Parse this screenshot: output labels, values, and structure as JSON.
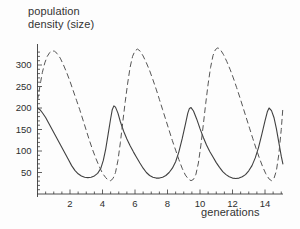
{
  "chart_data": {
    "type": "line",
    "title": "",
    "ylabel_lines": [
      "population",
      "density (size)"
    ],
    "ylabel": "population density (size)",
    "xlabel": "generations",
    "xlim": [
      0,
      15.1
    ],
    "ylim": [
      0,
      355
    ],
    "grid": false,
    "legend": "none",
    "xticks": [
      2,
      4,
      6,
      8,
      10,
      12,
      14
    ],
    "xtick_labels": [
      "2",
      "4",
      "6",
      "8",
      "10",
      "12",
      "14"
    ],
    "xminor_ticks": [
      0.5,
      1,
      1.5,
      2.5,
      3,
      3.5,
      4.5,
      5,
      5.5,
      6.5,
      7,
      7.5,
      8.5,
      9,
      9.5,
      10.5,
      11,
      11.5,
      12.5,
      13,
      13.5,
      14.5,
      15
    ],
    "yticks": [
      50,
      100,
      150,
      200,
      250,
      300
    ],
    "ytick_labels": [
      "50",
      "100",
      "150",
      "200",
      "250",
      "300"
    ],
    "yminor_ticks": [
      10,
      20,
      30,
      40,
      60,
      70,
      80,
      90,
      110,
      120,
      130,
      140,
      160,
      170,
      180,
      190,
      210,
      220,
      230,
      240,
      260,
      270,
      280,
      290,
      310,
      320,
      330
    ],
    "series": [
      {
        "name": "prey",
        "style": "solid",
        "color": "#404040",
        "points": [
          [
            0.0,
            200
          ],
          [
            0.15,
            196
          ],
          [
            0.3,
            189
          ],
          [
            0.5,
            178
          ],
          [
            0.7,
            164
          ],
          [
            0.9,
            150
          ],
          [
            1.1,
            136
          ],
          [
            1.3,
            122
          ],
          [
            1.5,
            108
          ],
          [
            1.7,
            94
          ],
          [
            1.9,
            80
          ],
          [
            2.1,
            66
          ],
          [
            2.3,
            55
          ],
          [
            2.5,
            47
          ],
          [
            2.7,
            42
          ],
          [
            2.9,
            39
          ],
          [
            3.1,
            38
          ],
          [
            3.3,
            39
          ],
          [
            3.5,
            42
          ],
          [
            3.7,
            48
          ],
          [
            3.9,
            60
          ],
          [
            4.05,
            78
          ],
          [
            4.2,
            105
          ],
          [
            4.35,
            140
          ],
          [
            4.5,
            175
          ],
          [
            4.6,
            196
          ],
          [
            4.7,
            205
          ],
          [
            4.8,
            202
          ],
          [
            4.95,
            188
          ],
          [
            5.1,
            168
          ],
          [
            5.3,
            146
          ],
          [
            5.5,
            128
          ],
          [
            5.7,
            112
          ],
          [
            5.9,
            98
          ],
          [
            6.1,
            85
          ],
          [
            6.3,
            72
          ],
          [
            6.5,
            60
          ],
          [
            6.7,
            50
          ],
          [
            6.9,
            43
          ],
          [
            7.1,
            39
          ],
          [
            7.3,
            37
          ],
          [
            7.5,
            37
          ],
          [
            7.7,
            39
          ],
          [
            7.9,
            43
          ],
          [
            8.1,
            50
          ],
          [
            8.3,
            60
          ],
          [
            8.5,
            75
          ],
          [
            8.7,
            98
          ],
          [
            8.9,
            128
          ],
          [
            9.1,
            162
          ],
          [
            9.25,
            188
          ],
          [
            9.35,
            199
          ],
          [
            9.45,
            201
          ],
          [
            9.6,
            193
          ],
          [
            9.8,
            174
          ],
          [
            10.0,
            152
          ],
          [
            10.2,
            132
          ],
          [
            10.4,
            114
          ],
          [
            10.6,
            99
          ],
          [
            10.8,
            86
          ],
          [
            11.0,
            73
          ],
          [
            11.2,
            62
          ],
          [
            11.4,
            52
          ],
          [
            11.6,
            45
          ],
          [
            11.8,
            40
          ],
          [
            12.0,
            37
          ],
          [
            12.2,
            36
          ],
          [
            12.4,
            37
          ],
          [
            12.6,
            40
          ],
          [
            12.8,
            45
          ],
          [
            13.0,
            54
          ],
          [
            13.2,
            66
          ],
          [
            13.4,
            84
          ],
          [
            13.6,
            108
          ],
          [
            13.8,
            138
          ],
          [
            14.0,
            170
          ],
          [
            14.15,
            192
          ],
          [
            14.25,
            200
          ],
          [
            14.4,
            194
          ],
          [
            14.55,
            178
          ],
          [
            14.7,
            152
          ],
          [
            14.85,
            120
          ],
          [
            15.0,
            88
          ],
          [
            15.1,
            70
          ]
        ]
      },
      {
        "name": "predator",
        "style": "dashed",
        "color": "#555555",
        "points": [
          [
            0.0,
            218
          ],
          [
            0.1,
            240
          ],
          [
            0.2,
            262
          ],
          [
            0.3,
            283
          ],
          [
            0.45,
            305
          ],
          [
            0.6,
            320
          ],
          [
            0.75,
            329
          ],
          [
            0.9,
            333
          ],
          [
            1.05,
            332
          ],
          [
            1.2,
            327
          ],
          [
            1.4,
            316
          ],
          [
            1.6,
            300
          ],
          [
            1.8,
            282
          ],
          [
            2.0,
            262
          ],
          [
            2.2,
            240
          ],
          [
            2.4,
            218
          ],
          [
            2.6,
            196
          ],
          [
            2.8,
            172
          ],
          [
            3.0,
            148
          ],
          [
            3.2,
            124
          ],
          [
            3.4,
            102
          ],
          [
            3.6,
            82
          ],
          [
            3.8,
            64
          ],
          [
            4.0,
            48
          ],
          [
            4.2,
            38
          ],
          [
            4.35,
            32
          ],
          [
            4.5,
            31
          ],
          [
            4.65,
            36
          ],
          [
            4.8,
            50
          ],
          [
            4.95,
            78
          ],
          [
            5.1,
            120
          ],
          [
            5.25,
            168
          ],
          [
            5.4,
            215
          ],
          [
            5.55,
            258
          ],
          [
            5.7,
            295
          ],
          [
            5.85,
            320
          ],
          [
            6.0,
            333
          ],
          [
            6.15,
            337
          ],
          [
            6.3,
            333
          ],
          [
            6.5,
            321
          ],
          [
            6.7,
            305
          ],
          [
            6.9,
            287
          ],
          [
            7.1,
            266
          ],
          [
            7.3,
            244
          ],
          [
            7.5,
            220
          ],
          [
            7.7,
            196
          ],
          [
            7.9,
            172
          ],
          [
            8.1,
            148
          ],
          [
            8.3,
            124
          ],
          [
            8.5,
            102
          ],
          [
            8.7,
            80
          ],
          [
            8.9,
            60
          ],
          [
            9.1,
            44
          ],
          [
            9.3,
            34
          ],
          [
            9.45,
            31
          ],
          [
            9.6,
            34
          ],
          [
            9.75,
            46
          ],
          [
            9.9,
            72
          ],
          [
            10.05,
            112
          ],
          [
            10.2,
            160
          ],
          [
            10.35,
            210
          ],
          [
            10.5,
            256
          ],
          [
            10.65,
            294
          ],
          [
            10.8,
            322
          ],
          [
            10.95,
            336
          ],
          [
            11.1,
            340
          ],
          [
            11.25,
            336
          ],
          [
            11.45,
            324
          ],
          [
            11.65,
            308
          ],
          [
            11.85,
            290
          ],
          [
            12.05,
            270
          ],
          [
            12.25,
            248
          ],
          [
            12.45,
            225
          ],
          [
            12.65,
            201
          ],
          [
            12.85,
            177
          ],
          [
            13.05,
            153
          ],
          [
            13.25,
            129
          ],
          [
            13.45,
            106
          ],
          [
            13.65,
            84
          ],
          [
            13.85,
            64
          ],
          [
            14.05,
            47
          ],
          [
            14.25,
            35
          ],
          [
            14.4,
            31
          ],
          [
            14.55,
            36
          ],
          [
            14.7,
            54
          ],
          [
            14.85,
            92
          ],
          [
            15.0,
            150
          ],
          [
            15.1,
            200
          ]
        ]
      }
    ]
  },
  "axes": {
    "x_axis_name": "x-axis",
    "y_axis_name": "y-axis"
  }
}
